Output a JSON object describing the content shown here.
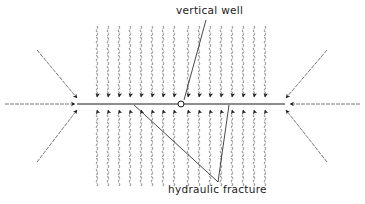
{
  "diagram": {
    "labels": {
      "vertical_well": "vertical well",
      "hydraulic_fracture": "hydraulic fracture"
    },
    "colors": {
      "line": "#1a1a1a",
      "flow_line": "#6a6a6a",
      "background": "#ffffff"
    },
    "fracture": {
      "x1": 77,
      "x2": 285,
      "y": 104
    },
    "well": {
      "cx": 181,
      "cy": 104,
      "r": 3
    },
    "flow_columns_x": [
      97,
      108,
      119,
      130,
      141,
      152,
      163,
      174,
      188,
      199,
      210,
      221,
      232,
      243,
      254,
      265
    ],
    "flow_top": {
      "y_start": 26,
      "y_tip": 97
    },
    "flow_bottom": {
      "y_start": 186,
      "y_tip": 110
    },
    "side_flows": [
      {
        "name": "left-horizontal",
        "x1": 5,
        "y1": 104,
        "x2": 75,
        "y2": 104
      },
      {
        "name": "right-horizontal",
        "x1": 360,
        "y1": 104,
        "x2": 290,
        "y2": 104
      },
      {
        "name": "upper-left-diagonal",
        "x1": 37,
        "y1": 50,
        "x2": 77,
        "y2": 98
      },
      {
        "name": "lower-left-diagonal",
        "x1": 37,
        "y1": 162,
        "x2": 77,
        "y2": 110
      },
      {
        "name": "upper-right-diagonal",
        "x1": 327,
        "y1": 50,
        "x2": 286,
        "y2": 98
      },
      {
        "name": "lower-right-diagonal",
        "x1": 327,
        "y1": 162,
        "x2": 286,
        "y2": 110
      }
    ],
    "pointers": {
      "vertical_well": {
        "x1": 206,
        "y1": 20,
        "x2": 184,
        "y2": 100
      },
      "hydraulic_fracture": [
        {
          "x1": 218,
          "y1": 182,
          "x2": 134,
          "y2": 105
        },
        {
          "x1": 218,
          "y1": 182,
          "x2": 229,
          "y2": 105
        }
      ]
    }
  }
}
